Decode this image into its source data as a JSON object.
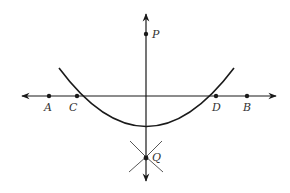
{
  "diagram": {
    "title": "",
    "type": "geometric construction: perpendicular from point P to line AB",
    "colors": {
      "stroke": "#1a1a1a",
      "background": "#ffffff",
      "label": "#333333"
    },
    "points": [
      {
        "id": "P",
        "label": "P",
        "x": 146,
        "y": 34,
        "label_x": 152,
        "label_y": 38
      },
      {
        "id": "A",
        "label": "A",
        "x": 49,
        "y": 96,
        "label_x": 44,
        "label_y": 111
      },
      {
        "id": "C",
        "label": "C",
        "x": 77,
        "y": 96,
        "label_x": 69,
        "label_y": 111
      },
      {
        "id": "D",
        "label": "D",
        "x": 216,
        "y": 96,
        "label_x": 212,
        "label_y": 111
      },
      {
        "id": "B",
        "label": "B",
        "x": 247,
        "y": 96,
        "label_x": 243,
        "label_y": 111
      },
      {
        "id": "Q",
        "label": "Q",
        "x": 146,
        "y": 158,
        "label_x": 152,
        "label_y": 161
      }
    ],
    "lines": [
      {
        "id": "line-AB",
        "description": "horizontal line through A, C, D, B with arrows at both ends"
      },
      {
        "id": "line-PQ",
        "description": "vertical line through P and Q with arrows at both ends"
      }
    ],
    "arcs": [
      {
        "id": "arc-CD",
        "description": "arc centered at P intersecting line AB at C and D"
      },
      {
        "id": "arcs-Q",
        "description": "two short intersecting arcs from C and D meeting at Q"
      }
    ]
  }
}
